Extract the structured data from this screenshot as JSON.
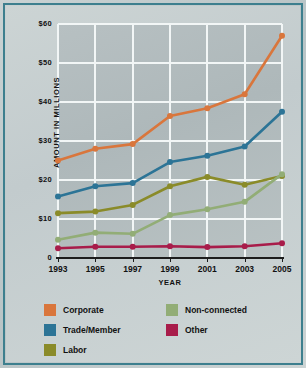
{
  "chart_data": {
    "type": "line",
    "title": "",
    "xlabel": "YEAR",
    "ylabel": "AMOUNT IN MILLIONS",
    "categories": [
      "1993",
      "1995",
      "1997",
      "1999",
      "2001",
      "2003",
      "2005"
    ],
    "x_tick_labels": [
      "1993",
      "1995",
      "1997",
      "1999",
      "2001",
      "2003",
      "2005"
    ],
    "y_tick_labels": [
      "$60",
      "$50",
      "$40",
      "$30",
      "$20",
      "$10",
      "0"
    ],
    "y_tick_values": [
      60,
      50,
      40,
      30,
      20,
      10,
      0
    ],
    "ylim": [
      0,
      60
    ],
    "grid": true,
    "legend_position": "bottom",
    "series": [
      {
        "name": "Corporate",
        "color": "#d9763c",
        "values": [
          25.0,
          28.0,
          29.2,
          36.4,
          38.4,
          42.0,
          57.0
        ]
      },
      {
        "name": "Trade/Member",
        "color": "#2c7496",
        "values": [
          15.8,
          18.4,
          19.2,
          24.6,
          26.2,
          28.6,
          37.5
        ]
      },
      {
        "name": "Labor",
        "color": "#8a8b29",
        "values": [
          11.5,
          11.9,
          13.6,
          18.4,
          20.8,
          18.8,
          21.0
        ]
      },
      {
        "name": "Non-connected",
        "color": "#92ad76",
        "values": [
          4.7,
          6.5,
          6.2,
          11.0,
          12.5,
          14.4,
          21.5
        ]
      },
      {
        "name": "Other",
        "color": "#a81c4a",
        "values": [
          2.5,
          2.9,
          2.9,
          3.0,
          2.8,
          3.0,
          3.8
        ]
      }
    ]
  },
  "legend": {
    "column1": [
      "Corporate",
      "Trade/Member",
      "Labor"
    ],
    "column2": [
      "Non-connected",
      "Other"
    ]
  },
  "colors": {
    "corporate": "#d9763c",
    "trade_member": "#2c7496",
    "labor": "#8a8b29",
    "non_connected": "#92ad76",
    "other": "#a81c4a",
    "frame_border": "#3d7f8e",
    "gridline": "#f2f6f6",
    "axis": "#1c1c1c"
  }
}
